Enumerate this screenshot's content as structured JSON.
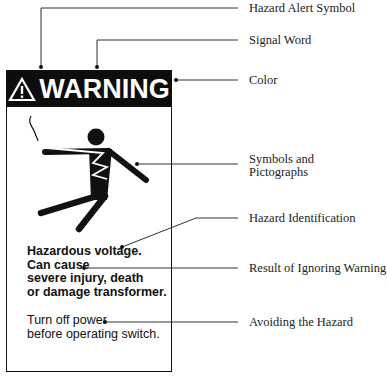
{
  "sign": {
    "signal_word": "WARNING",
    "alert_icon": "hazard-alert-triangle-icon",
    "pictograph": "electric-shock-person-icon",
    "hazard_lines": [
      "Hazardous voltage.",
      "Can cause",
      "severe injury, death",
      "or damage transformer."
    ],
    "avoid_lines": [
      "Turn off power",
      "before operating switch."
    ],
    "header_color": "#0d0d0d"
  },
  "labels": {
    "hazard_alert_symbol": "Hazard Alert Symbol",
    "signal_word": "Signal Word",
    "color": "Color",
    "symbols_line1": "Symbols and",
    "symbols_line2": "Pictographs",
    "hazard_identification": "Hazard Identification",
    "result": "Result of Ignoring Warning",
    "avoiding": "Avoiding the Hazard"
  }
}
